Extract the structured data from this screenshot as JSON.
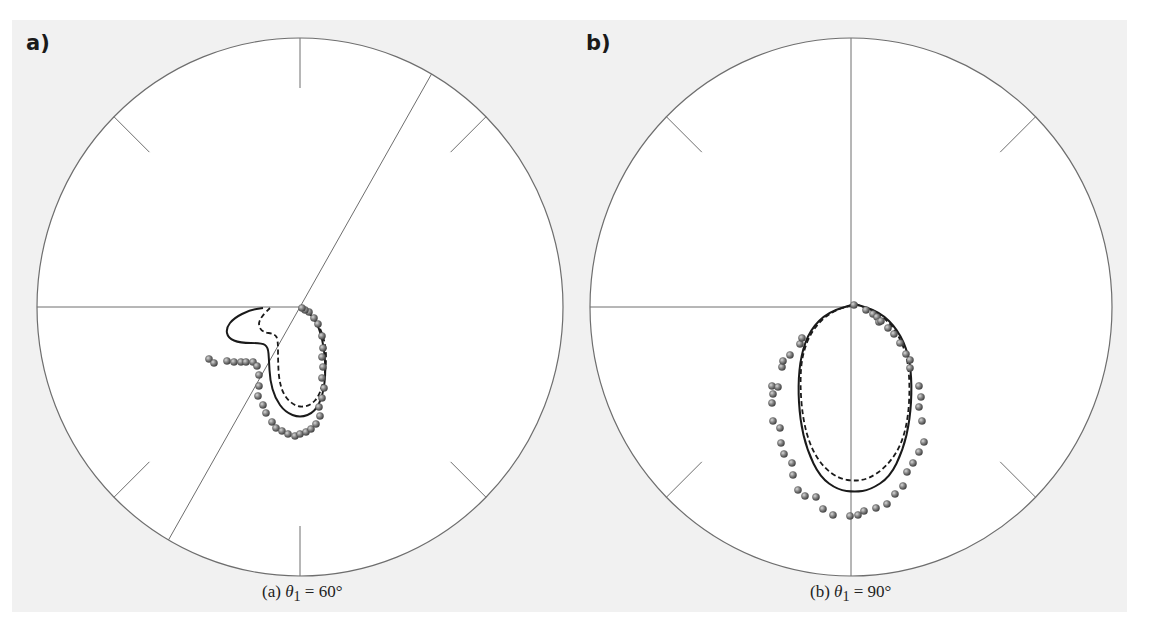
{
  "chart_data": [
    {
      "type": "scatter",
      "subtype": "polar",
      "panel_label": "a)",
      "caption": {
        "prefix": "(a) ",
        "symbol": "θ",
        "subscript": "1",
        "suffix": " = 60°"
      },
      "theta1_deg": 60,
      "center": [
        300,
        307
      ],
      "radius": [
        263,
        269
      ],
      "ticks_deg": [
        45,
        90,
        135,
        225,
        270,
        315
      ],
      "reference_lines": [
        {
          "type": "radial",
          "from_deg": 180,
          "label": "horizontal left radius"
        },
        {
          "type": "diameter",
          "angle_deg": 60,
          "label": "incidence direction"
        }
      ],
      "series": [
        {
          "name": "solid",
          "style": "solid",
          "points": [
            [
              263,
              308
            ],
            [
              250,
              310
            ],
            [
              234,
              318
            ],
            [
              226,
              328
            ],
            [
              228,
              338
            ],
            [
              240,
              343
            ],
            [
              262,
              343
            ],
            [
              268,
              347
            ],
            [
              269,
              360
            ],
            [
              270,
              380
            ],
            [
              275,
              398
            ],
            [
              285,
              412
            ],
            [
              300,
              418
            ],
            [
              315,
              412
            ],
            [
              323,
              395
            ],
            [
              326,
              370
            ],
            [
              323,
              340
            ],
            [
              315,
              318
            ],
            [
              302,
              308
            ]
          ]
        },
        {
          "name": "dashed",
          "style": "dashed",
          "points": [
            [
              270,
              308
            ],
            [
              262,
              316
            ],
            [
              258,
              324
            ],
            [
              262,
              332
            ],
            [
              275,
              334
            ],
            [
              278,
              340
            ],
            [
              278,
              360
            ],
            [
              279,
              380
            ],
            [
              284,
              396
            ],
            [
              296,
              407
            ],
            [
              310,
              406
            ],
            [
              320,
              395
            ],
            [
              326,
              370
            ],
            [
              326,
              345
            ],
            [
              318,
              322
            ],
            [
              305,
              309
            ]
          ]
        },
        {
          "name": "measured",
          "style": "dots",
          "points": [
            [
              209,
              359
            ],
            [
              214,
              363
            ],
            [
              227,
              361
            ],
            [
              234,
              362
            ],
            [
              241,
              362
            ],
            [
              246,
              362
            ],
            [
              253,
              362
            ],
            [
              257,
              366
            ],
            [
              259,
              375
            ],
            [
              259,
              386
            ],
            [
              258,
              396
            ],
            [
              263,
              405
            ],
            [
              266,
              413
            ],
            [
              272,
              422
            ],
            [
              276,
              428
            ],
            [
              282,
              431
            ],
            [
              288,
              434
            ],
            [
              295,
              436
            ],
            [
              300,
              434
            ],
            [
              306,
              432
            ],
            [
              311,
              429
            ],
            [
              316,
              424
            ],
            [
              320,
              416
            ],
            [
              319,
              407
            ],
            [
              322,
              398
            ],
            [
              324,
              388
            ],
            [
              322,
              378
            ],
            [
              323,
              367
            ],
            [
              322,
              357
            ],
            [
              323,
              348
            ],
            [
              322,
              336
            ],
            [
              318,
              324
            ],
            [
              314,
              318
            ],
            [
              309,
              312
            ],
            [
              305,
              310
            ],
            [
              302,
              308
            ]
          ]
        }
      ]
    },
    {
      "type": "scatter",
      "subtype": "polar",
      "panel_label": "b)",
      "caption": {
        "prefix": "(b) ",
        "symbol": "θ",
        "subscript": "1",
        "suffix": " = 90°"
      },
      "theta1_deg": 90,
      "center": [
        851,
        307
      ],
      "radius": [
        261,
        269
      ],
      "ticks_deg": [
        45,
        135,
        225,
        315
      ],
      "reference_lines": [
        {
          "type": "radial",
          "from_deg": 180,
          "label": "horizontal left radius"
        },
        {
          "type": "diameter",
          "angle_deg": 90,
          "label": "incidence direction"
        }
      ],
      "series": [
        {
          "name": "solid",
          "style": "solid",
          "points": [
            [
              855,
              304
            ],
            [
              880,
              312
            ],
            [
              898,
              330
            ],
            [
              909,
              355
            ],
            [
              912,
              385
            ],
            [
              910,
              420
            ],
            [
              903,
              450
            ],
            [
              890,
              477
            ],
            [
              870,
              490
            ],
            [
              855,
              492
            ],
            [
              838,
              490
            ],
            [
              820,
              477
            ],
            [
              807,
              450
            ],
            [
              800,
              420
            ],
            [
              798,
              385
            ],
            [
              801,
              355
            ],
            [
              810,
              330
            ],
            [
              828,
              312
            ],
            [
              855,
              304
            ]
          ]
        },
        {
          "name": "dashed",
          "style": "dashed",
          "points": [
            [
              855,
              304
            ],
            [
              878,
              312
            ],
            [
              896,
              330
            ],
            [
              907,
              355
            ],
            [
              910,
              385
            ],
            [
              908,
              420
            ],
            [
              900,
              448
            ],
            [
              885,
              468
            ],
            [
              868,
              479
            ],
            [
              855,
              481
            ],
            [
              840,
              479
            ],
            [
              824,
              468
            ],
            [
              811,
              448
            ],
            [
              803,
              420
            ],
            [
              800,
              385
            ],
            [
              802,
              355
            ],
            [
              812,
              330
            ],
            [
              830,
              312
            ],
            [
              855,
              304
            ]
          ]
        },
        {
          "name": "measured",
          "style": "dots",
          "points": [
            [
              854,
              305
            ],
            [
              866,
              310
            ],
            [
              873,
              314
            ],
            [
              877,
              317
            ],
            [
              879,
              322
            ],
            [
              881,
              321
            ],
            [
              888,
              328
            ],
            [
              894,
              334
            ],
            [
              900,
              343
            ],
            [
              906,
              354
            ],
            [
              910,
              360
            ],
            [
              910,
              368
            ],
            [
              919,
              386
            ],
            [
              921,
              397
            ],
            [
              919,
              407
            ],
            [
              922,
              421
            ],
            [
              924,
              442
            ],
            [
              919,
              452
            ],
            [
              913,
              463
            ],
            [
              907,
              472
            ],
            [
              903,
              486
            ],
            [
              895,
              494
            ],
            [
              887,
              504
            ],
            [
              876,
              508
            ],
            [
              864,
              511
            ],
            [
              858,
              515
            ],
            [
              850,
              516
            ],
            [
              833,
              515
            ],
            [
              823,
              509
            ],
            [
              816,
              497
            ],
            [
              805,
              496
            ],
            [
              798,
              490
            ],
            [
              793,
              475
            ],
            [
              792,
              463
            ],
            [
              784,
              454
            ],
            [
              781,
              443
            ],
            [
              780,
              428
            ],
            [
              773,
              421
            ],
            [
              772,
              403
            ],
            [
              773,
              394
            ],
            [
              772,
              386
            ],
            [
              778,
              387
            ],
            [
              782,
              367
            ],
            [
              783,
              361
            ],
            [
              790,
              355
            ],
            [
              800,
              344
            ],
            [
              802,
              338
            ]
          ]
        }
      ]
    }
  ],
  "figure": {
    "background": "#f1f1f1",
    "plot_fill": "#ffffff",
    "axis_color": "#6e6e6e",
    "curve_color": "#1a1a1a",
    "dot_color": "#7a7a7a"
  }
}
